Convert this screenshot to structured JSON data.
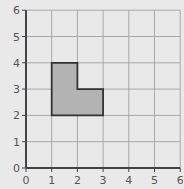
{
  "diagram": {
    "type": "coordinate-grid",
    "x_axis": {
      "min": 0,
      "max": 6,
      "ticks": [
        "0",
        "1",
        "2",
        "3",
        "4",
        "5",
        "6"
      ]
    },
    "y_axis": {
      "min": 0,
      "max": 6,
      "ticks": [
        "0",
        "1",
        "2",
        "3",
        "4",
        "5",
        "6"
      ]
    },
    "grid": true,
    "shape": {
      "name": "L-shape",
      "fill": "#b3b3b3",
      "stroke": "#333333",
      "vertices": [
        [
          1,
          2
        ],
        [
          1,
          4
        ],
        [
          2,
          4
        ],
        [
          2,
          3
        ],
        [
          3,
          3
        ],
        [
          3,
          2
        ]
      ]
    },
    "colors": {
      "background": "#e9e9e9",
      "grid": "#a8a8a8",
      "axis": "#444444",
      "label": "#555555"
    }
  }
}
